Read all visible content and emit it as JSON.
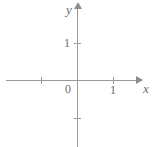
{
  "figure": {
    "title": "",
    "width": 154,
    "height": 147,
    "background_color": "#ffffff",
    "line_color": "#9a9a9a",
    "text_color": "#6a6a6a"
  },
  "labels": {
    "x_axis": "x",
    "y_axis": "y",
    "origin": "0",
    "x_one": "1",
    "y_one": "1"
  },
  "chart_data": {
    "type": "scatter",
    "title": "",
    "xlabel": "x",
    "ylabel": "y",
    "xlim": [
      -2,
      2
    ],
    "ylim": [
      -2,
      2
    ],
    "grid": false,
    "legend": null,
    "x": [],
    "y": [],
    "series": [],
    "annotations": [],
    "xticks": [
      -1,
      0,
      1
    ],
    "xticklabels": [
      "",
      "0",
      "1"
    ],
    "yticks": [
      -1,
      0,
      1
    ],
    "yticklabels": [
      "",
      "0",
      "1"
    ],
    "axis_arrows": {
      "x_positive": true,
      "y_positive": true
    }
  }
}
